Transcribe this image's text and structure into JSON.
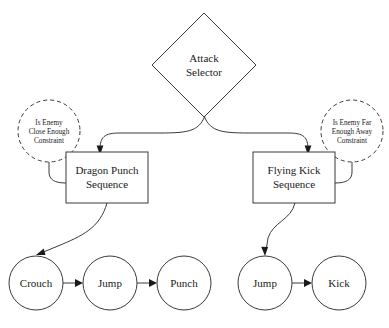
{
  "diagram": {
    "type": "behavior-tree",
    "background_color": "#ffffff",
    "stroke_color": "#3a3a3a",
    "text_color": "#1a1a1a",
    "root": {
      "shape": "diamond",
      "name": "attack-selector",
      "line1": "Attack",
      "line2": "Selector"
    },
    "constraints": [
      {
        "name": "is-enemy-close-enough-constraint",
        "shape": "dashed-circle",
        "line1": "Is Enemy",
        "line2": "Close Enough",
        "line3": "Constraint"
      },
      {
        "name": "is-enemy-far-enough-away-constraint",
        "shape": "dashed-circle",
        "line1": "Is Enemy Far",
        "line2": "Enough Away",
        "line3": "Constraint"
      }
    ],
    "sequences": [
      {
        "name": "dragon-punch-sequence",
        "shape": "rectangle",
        "line1": "Dragon Punch",
        "line2": "Sequence"
      },
      {
        "name": "flying-kick-sequence",
        "shape": "rectangle",
        "line1": "Flying Kick",
        "line2": "Sequence"
      }
    ],
    "actions_left": [
      {
        "name": "action-crouch",
        "label": "Crouch"
      },
      {
        "name": "action-jump-left",
        "label": "Jump"
      },
      {
        "name": "action-punch",
        "label": "Punch"
      }
    ],
    "actions_right": [
      {
        "name": "action-jump-right",
        "label": "Jump"
      },
      {
        "name": "action-kick",
        "label": "Kick"
      }
    ]
  }
}
